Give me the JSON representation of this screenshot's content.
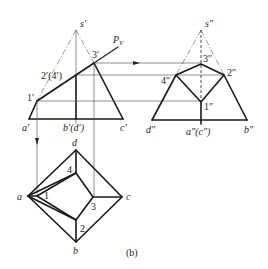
{
  "figure": {
    "caption": "(b)",
    "front_view": {
      "labels": {
        "apex": "s′",
        "plane": "P",
        "plane_sub": "V",
        "p1": "1′",
        "p2_4": "2′(4′)",
        "p3": "3′",
        "a": "a′",
        "bd": "b′(d′)",
        "c": "c′"
      }
    },
    "side_view": {
      "labels": {
        "apex": "s″",
        "p1": "1″",
        "p2": "2″",
        "p3": "3″",
        "p4": "4″",
        "d": "d″",
        "ac": "a″(c″)",
        "b": "b″"
      }
    },
    "top_view": {
      "labels": {
        "a": "a",
        "b": "b",
        "c": "c",
        "d": "d",
        "p1": "1",
        "p2": "2",
        "p3": "3",
        "p4": "4"
      }
    },
    "colors": {
      "line": "#1a1a1a",
      "background": "#ffffff"
    }
  }
}
